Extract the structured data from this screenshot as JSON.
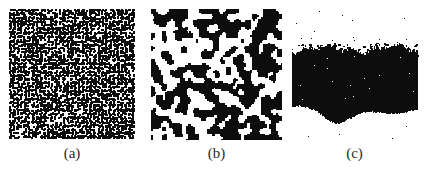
{
  "figure": {
    "name": "three-panel-binary-texture-figure",
    "background_color": "#ffffff",
    "ink_color": "#0d0d0d",
    "label_color": "#2b2b2b",
    "width": 428,
    "height": 171
  },
  "panels": [
    {
      "id": "a",
      "label": "(a)",
      "caption_text": "(a)",
      "kind": "binary-noise-texture",
      "description": "fine-grained random black-and-white speckle",
      "x": 9,
      "y": 9,
      "width": 126,
      "height": 130,
      "cell_size": 1.35,
      "fill_fraction": 0.46,
      "smoothing_passes": 0,
      "cluster_scale": 1.0,
      "seed": 20431,
      "border": "none",
      "fg": "#0d0d0d",
      "bg": "#ffffff"
    },
    {
      "id": "b",
      "label": "(b)",
      "caption_text": "(b)",
      "kind": "binary-cluster-texture",
      "description": "coarser clustered percolation-like black-and-white pattern",
      "x": 151,
      "y": 9,
      "width": 131,
      "height": 131,
      "cell_size": 1.6,
      "fill_fraction": 0.47,
      "smoothing_passes": 2,
      "cluster_scale": 4.0,
      "seed": 77129,
      "border": "none",
      "fg": "#0d0d0d",
      "bg": "#ffffff"
    },
    {
      "id": "c",
      "label": "(c)",
      "caption_text": "(c)",
      "kind": "solid-mass-texture",
      "description": "near-solid black mass with ragged top edge and wavy concave bottom edge, sparse white pinholes inside and stray black specks outside",
      "x": 288,
      "y": 4,
      "width": 133,
      "height": 136,
      "mass_left": 4,
      "mass_right": 129,
      "mass_top_mean": 45,
      "mass_top_roughness": 5,
      "bottom_profile": [
        103,
        102,
        104,
        106,
        111,
        117,
        120,
        118,
        114,
        110,
        108,
        108,
        109,
        110,
        110,
        109,
        107,
        106
      ],
      "pinhole_count": 16,
      "stray_speck_count": 18,
      "seed": 51077,
      "border": "none",
      "fg": "#0d0d0d",
      "bg": "#ffffff"
    }
  ],
  "chart_data": {
    "type": "heatmap",
    "title": "",
    "subtitle": "",
    "xlabel": "",
    "ylabel": "",
    "grid": false,
    "legend_position": "none",
    "panel_labels": [
      "(a)",
      "(b)",
      "(c)"
    ],
    "series": [
      {
        "name": "(a)",
        "metric": "black_pixel_fraction",
        "values": [
          0.46
        ],
        "grain": "fine",
        "correlation_length_px": 1.4
      },
      {
        "name": "(b)",
        "metric": "black_pixel_fraction",
        "values": [
          0.47
        ],
        "grain": "coarse",
        "correlation_length_px": 6.0
      },
      {
        "name": "(c)",
        "metric": "black_pixel_fraction",
        "values": [
          0.97
        ],
        "grain": "solid",
        "correlation_length_px": 130.0
      }
    ]
  }
}
